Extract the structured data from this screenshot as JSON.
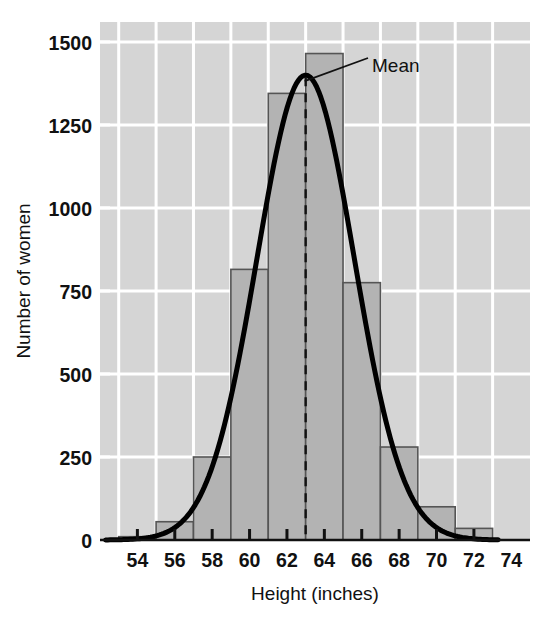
{
  "chart_data": {
    "type": "bar",
    "title": "",
    "subtitle": "",
    "xlabel": "Height (inches)",
    "ylabel": "Number of women",
    "xlim": [
      52,
      75
    ],
    "ylim": [
      0,
      1560
    ],
    "xticks": [
      54,
      56,
      58,
      60,
      62,
      64,
      66,
      68,
      70,
      72,
      74
    ],
    "xtick_labels": [
      "54",
      "56",
      "58",
      "60",
      "62",
      "64",
      "66",
      "68",
      "70",
      "72",
      "74"
    ],
    "yticks": [
      0,
      250,
      500,
      750,
      1000,
      1250,
      1500
    ],
    "ytick_labels": [
      "0",
      "250",
      "500",
      "750",
      "1000",
      "1250",
      "1500"
    ],
    "grid": "both-white-gridlines",
    "legend": "none",
    "bin_width": 2,
    "categories": [
      54,
      56,
      58,
      60,
      62,
      64,
      66,
      68,
      70,
      72
    ],
    "bin_edges": [
      53,
      55,
      57,
      59,
      61,
      63,
      65,
      67,
      69,
      71,
      73
    ],
    "values": [
      10,
      55,
      250,
      815,
      1345,
      1465,
      775,
      280,
      100,
      35
    ],
    "bar_fill": "#b3b3b3",
    "bar_edge": "#555555",
    "plot_background": "#d5d5d5",
    "gridline_color": "#ffffff",
    "curve": {
      "name": "normal-curve",
      "kind": "line",
      "color": "#000000",
      "mean": 63.0,
      "std_dev": 2.6,
      "peak_value": 1400,
      "description": "smooth bell curve overlay"
    },
    "annotations": [
      {
        "name": "mean-annotation",
        "label": "Mean",
        "x": 63.0,
        "y": 1400,
        "kind": "leader-line-with-text"
      },
      {
        "name": "mean-dashed-line",
        "label": "",
        "x": 63.0,
        "kind": "vertical-dashed-line",
        "color": "#111111"
      }
    ]
  },
  "axes": {
    "y_axis_title": "Number of women",
    "x_axis_title": "Height (inches)"
  },
  "annotation_labels": {
    "mean": "Mean"
  }
}
